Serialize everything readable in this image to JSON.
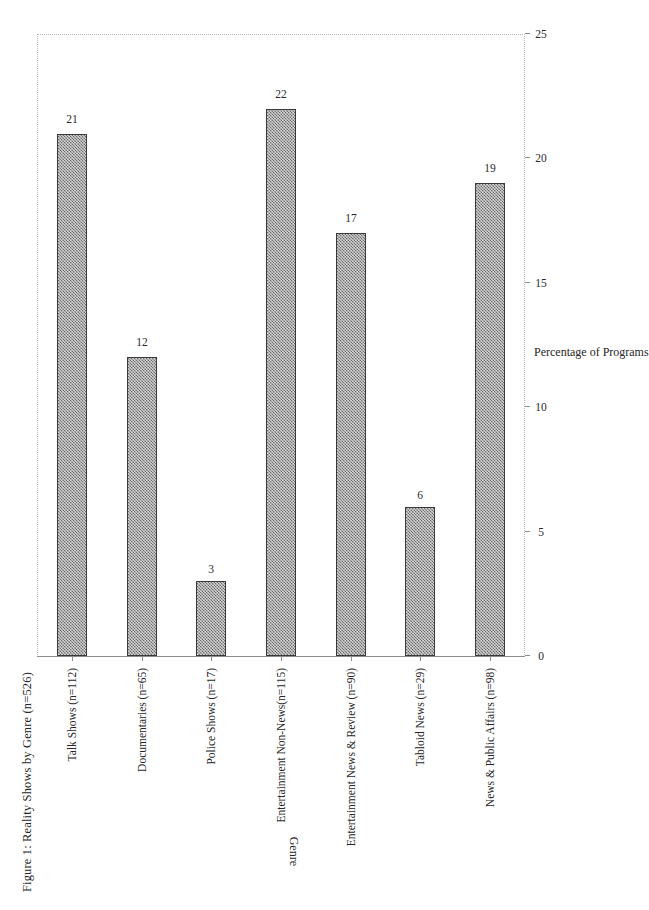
{
  "figure": {
    "title": "Figure 1: Reality Shows by Genre (n=526)",
    "orientation": "page-rotated-90",
    "bar_fill_color": "#6e6e6e",
    "bar_border_color": "#3a3a3a",
    "frame_color": "#b9b9b9"
  },
  "chart_data": {
    "type": "bar",
    "title": "Figure 1: Reality Shows by Genre (n=526)",
    "xlabel": "Genre",
    "ylabel": "Percentage of Programs",
    "ylim": [
      0,
      25
    ],
    "yticks": [
      0,
      5,
      10,
      15,
      20,
      25
    ],
    "grid": false,
    "legend": "none",
    "orientation": "vertical-bars-rendered-sideways",
    "categories": [
      "Talk Shows (n=112)",
      "Documentaries (n=65)",
      "Police Shows (n=17)",
      "Entertainment Non-News(n=115)",
      "Entertainment News & Review (n=90)",
      "Tabloid News (n=29)",
      "News & Public Affairs (n=98)"
    ],
    "values": [
      21,
      12,
      3,
      22,
      17,
      6,
      19
    ],
    "data_labels": [
      "21",
      "12",
      "3",
      "22",
      "17",
      "6",
      "19"
    ],
    "sample_sizes": [
      112,
      65,
      17,
      115,
      90,
      29,
      98
    ],
    "total_n": 526
  }
}
